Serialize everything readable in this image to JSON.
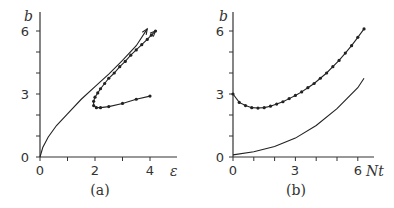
{
  "chart_data": [
    {
      "panel": "(a)",
      "type": "line",
      "xlabel": "ε",
      "ylabel": "b",
      "xlim": [
        0,
        4.6
      ],
      "ylim": [
        0,
        6.6
      ],
      "xticks": [
        0,
        2,
        4
      ],
      "yticks": [
        0,
        3,
        6
      ],
      "grid": false,
      "series": [
        {
          "name": "solid curve (no markers, with arrow)",
          "marker": false,
          "x": [
            0,
            0.1,
            0.3,
            0.6,
            1.0,
            1.5,
            2.0,
            2.5,
            3.0,
            3.5,
            3.9
          ],
          "y": [
            0,
            0.45,
            0.95,
            1.5,
            2.05,
            2.75,
            3.35,
            3.95,
            4.6,
            5.3,
            6.1
          ]
        },
        {
          "name": "dotted curve (markers, with arrow)",
          "marker": true,
          "x": [
            4.0,
            3.5,
            3.0,
            2.5,
            2.2,
            2.05,
            1.95,
            1.95,
            2.0,
            2.1,
            2.2,
            2.35,
            2.5,
            2.7,
            2.9,
            3.1,
            3.3,
            3.5,
            3.7,
            3.9,
            4.05,
            4.2
          ],
          "y": [
            2.9,
            2.75,
            2.55,
            2.4,
            2.35,
            2.35,
            2.45,
            2.65,
            2.85,
            3.05,
            3.25,
            3.5,
            3.75,
            4.0,
            4.3,
            4.55,
            4.85,
            5.1,
            5.35,
            5.6,
            5.8,
            6.0
          ]
        }
      ]
    },
    {
      "panel": "(b)",
      "type": "line",
      "xlabel": "Nt",
      "ylabel": "b",
      "xlim": [
        0,
        6.8
      ],
      "ylim": [
        0,
        6.6
      ],
      "xticks": [
        0,
        3,
        6
      ],
      "yticks": [
        0,
        3,
        6
      ],
      "grid": false,
      "series": [
        {
          "name": "dotted curve (markers)",
          "marker": true,
          "x": [
            0,
            0.3,
            0.6,
            0.9,
            1.2,
            1.5,
            1.8,
            2.1,
            2.4,
            2.7,
            3.0,
            3.3,
            3.6,
            3.9,
            4.2,
            4.5,
            4.8,
            5.1,
            5.4,
            5.7,
            6.0,
            6.3
          ],
          "y": [
            3.0,
            2.6,
            2.45,
            2.35,
            2.33,
            2.35,
            2.42,
            2.52,
            2.63,
            2.78,
            2.93,
            3.1,
            3.3,
            3.5,
            3.75,
            4.0,
            4.3,
            4.6,
            4.95,
            5.3,
            5.7,
            6.1
          ]
        },
        {
          "name": "solid curve (no markers)",
          "marker": false,
          "x": [
            0,
            1,
            2,
            3,
            4,
            5,
            6,
            6.3
          ],
          "y": [
            0.1,
            0.25,
            0.5,
            0.9,
            1.5,
            2.3,
            3.3,
            3.75
          ]
        }
      ]
    }
  ],
  "labels": {
    "a": {
      "caption": "(a)",
      "xlabel": "ε",
      "ylabel": "b",
      "xticks": [
        "0",
        "2",
        "4"
      ],
      "yticks": [
        "0",
        "3",
        "6"
      ]
    },
    "b": {
      "caption": "(b)",
      "xlabel": "Nt",
      "ylabel": "b",
      "xticks": [
        "0",
        "3",
        "6"
      ],
      "yticks": [
        "0",
        "3",
        "6"
      ]
    }
  }
}
